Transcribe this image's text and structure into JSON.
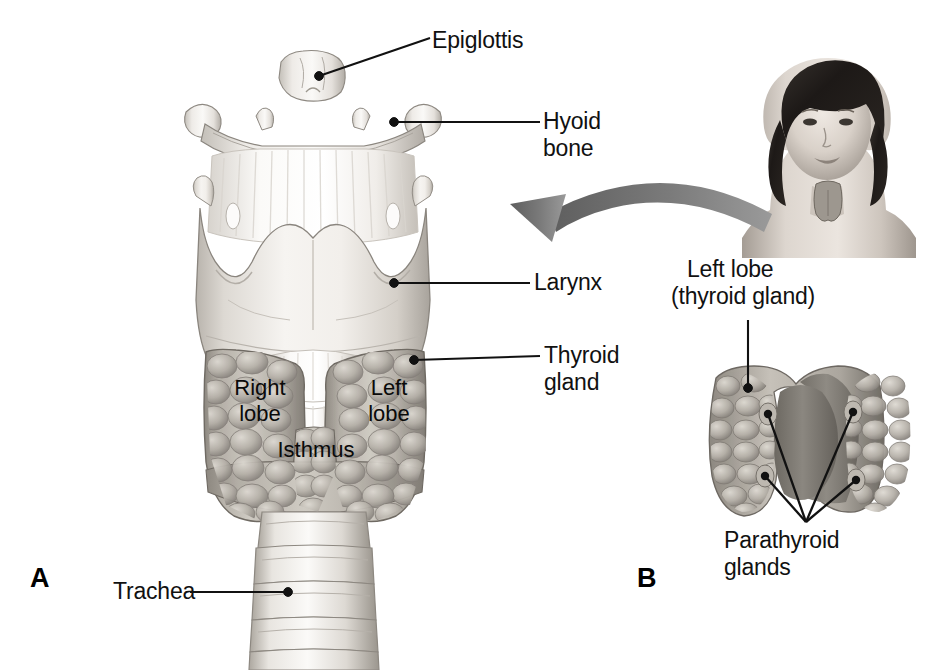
{
  "figure": {
    "background_color": "#ffffff",
    "ink_color": "#111111",
    "panels": [
      {
        "letter": "A",
        "caption": "Anterior view of larynx, thyroid gland and trachea"
      },
      {
        "letter": "B",
        "caption": "Posterior view of thyroid gland with parathyroid glands"
      }
    ]
  },
  "panel_a": {
    "letter": "A",
    "labels": {
      "epiglottis": "Epiglottis",
      "hyoid_bone_line1": "Hyoid",
      "hyoid_bone_line2": "bone",
      "larynx": "Larynx",
      "thyroid_gland_line1": "Thyroid",
      "thyroid_gland_line2": "gland",
      "trachea": "Trachea",
      "right_lobe_line1": "Right",
      "right_lobe_line2": "lobe",
      "left_lobe_line1": "Left",
      "left_lobe_line2": "lobe",
      "isthmus": "Isthmus"
    }
  },
  "panel_b": {
    "letter": "B",
    "labels": {
      "left_lobe_line1": "Left lobe",
      "left_lobe_line2": "(thyroid gland)",
      "parathyroid_line1": "Parathyroid",
      "parathyroid_line2": "glands"
    },
    "parathyroid_gland_count": 4
  },
  "inset": {
    "description": "grayscale illustration of a woman showing thyroid location at the neck",
    "arrow": "curved-arrow-pointing-left"
  },
  "colors": {
    "cartilage_light": "#f2f0ee",
    "cartilage_mid": "#d8d4cf",
    "cartilage_shadow": "#b5b0aa",
    "gland_light": "#cfcbc4",
    "gland_mid": "#a9a49c",
    "gland_dark": "#7e7a73",
    "arrow_gray": "#6e6e6e",
    "leader_line": "#111111",
    "skin_light": "#e3ddd7",
    "skin_mid": "#b9b2aa",
    "hair_dark": "#1f1c1a"
  }
}
